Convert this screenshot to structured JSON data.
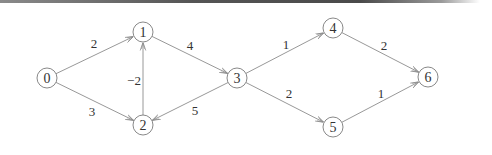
{
  "diagram": {
    "type": "directed-weighted-graph",
    "nodes": [
      {
        "id": "0",
        "label": "0",
        "x": 47,
        "y": 78
      },
      {
        "id": "1",
        "label": "1",
        "x": 143,
        "y": 32
      },
      {
        "id": "2",
        "label": "2",
        "x": 143,
        "y": 125
      },
      {
        "id": "3",
        "label": "3",
        "x": 237,
        "y": 78
      },
      {
        "id": "4",
        "label": "4",
        "x": 333,
        "y": 28
      },
      {
        "id": "5",
        "label": "5",
        "x": 333,
        "y": 127
      },
      {
        "id": "6",
        "label": "6",
        "x": 428,
        "y": 77
      }
    ],
    "edges": [
      {
        "from": "0",
        "to": "1",
        "weight": "2",
        "lx": 94,
        "ly": 43
      },
      {
        "from": "0",
        "to": "2",
        "weight": "3",
        "lx": 92,
        "ly": 111
      },
      {
        "from": "2",
        "to": "1",
        "weight": "−2",
        "lx": 134,
        "ly": 80
      },
      {
        "from": "1",
        "to": "3",
        "weight": "4",
        "lx": 190,
        "ly": 45
      },
      {
        "from": "3",
        "to": "2",
        "weight": "5",
        "lx": 195,
        "ly": 110
      },
      {
        "from": "3",
        "to": "4",
        "weight": "1",
        "lx": 286,
        "ly": 44
      },
      {
        "from": "3",
        "to": "5",
        "weight": "2",
        "lx": 289,
        "ly": 93
      },
      {
        "from": "4",
        "to": "6",
        "weight": "2",
        "lx": 384,
        "ly": 45
      },
      {
        "from": "5",
        "to": "6",
        "weight": "1",
        "lx": 381,
        "ly": 93
      }
    ]
  },
  "style": {
    "edge_color": "#8c8c8c",
    "node_stroke": "#7a7a7a",
    "text_color": "#333333",
    "node_radius": 10
  }
}
